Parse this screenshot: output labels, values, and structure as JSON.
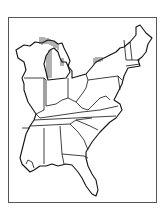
{
  "map": {
    "title": "",
    "region": "Eastern United States",
    "style": "black line outline map with vertical hatching along Great Lakes shorelines",
    "colors": {
      "line": "#111111",
      "frame": "#555555",
      "background": "#ffffff"
    },
    "hatched_areas": [
      "Lake Superior south shore (Upper Michigan)",
      "Lake Michigan shore",
      "Lake Huron shore",
      "Lake Ontario shore (New York)"
    ],
    "labels": []
  }
}
